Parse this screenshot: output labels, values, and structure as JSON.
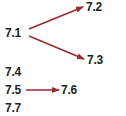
{
  "diagram": {
    "nodes": [
      {
        "id": "7.1",
        "label": "7.1"
      },
      {
        "id": "7.2",
        "label": "7.2"
      },
      {
        "id": "7.3",
        "label": "7.3"
      },
      {
        "id": "7.4",
        "label": "7.4"
      },
      {
        "id": "7.5",
        "label": "7.5"
      },
      {
        "id": "7.6",
        "label": "7.6"
      },
      {
        "id": "7.7",
        "label": "7.7"
      }
    ],
    "edges": [
      {
        "from": "7.1",
        "to": "7.2"
      },
      {
        "from": "7.1",
        "to": "7.3"
      },
      {
        "from": "7.5",
        "to": "7.6"
      }
    ],
    "arrow_color": "#9b2a2f",
    "text_color": "#222222"
  }
}
